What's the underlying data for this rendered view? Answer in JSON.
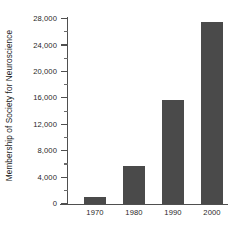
{
  "chart_data": {
    "type": "bar",
    "title": "",
    "subtitle": "",
    "xlabel": "",
    "ylabel": "Membership of Society for Neuroscience",
    "categories": [
      "1970",
      "1980",
      "1990",
      "2000"
    ],
    "values": [
      1100,
      5700,
      15800,
      27500
    ],
    "series": [
      {
        "name": "Membership of Society for Neuroscience",
        "values": [
          1100,
          5700,
          15800,
          27500
        ]
      }
    ],
    "ylim": [
      0,
      28000
    ],
    "xlim_categories": 4,
    "y_major_ticks": [
      0,
      4000,
      8000,
      12000,
      16000,
      20000,
      24000,
      28000
    ],
    "y_minor_ticks": [
      2000,
      6000,
      10000,
      14000,
      18000,
      22000,
      26000
    ],
    "y_tick_labels": [
      "0",
      "4,000",
      "8,000",
      "12,000",
      "16,000",
      "20,000",
      "24,000",
      "28,000"
    ],
    "x_tick_labels": [
      "1970",
      "1980",
      "1990",
      "2000"
    ],
    "grid": false,
    "legend": false,
    "legend_position": "none",
    "bar_color": "#4a4a4a",
    "axis_color": "#4f4f4f",
    "text_color": "#1f1f1f",
    "background_color": "#ffffff",
    "annotations": []
  }
}
